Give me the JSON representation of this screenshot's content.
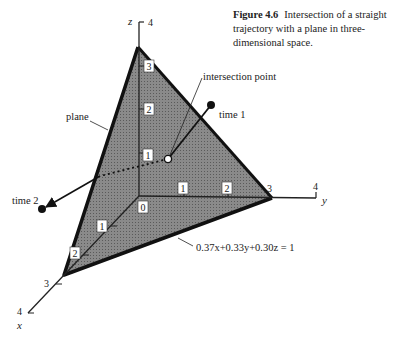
{
  "caption": {
    "figure_label": "Figure 4.6",
    "text": "Intersection of a straight trajectory with a plane in three-dimensional space."
  },
  "axes": {
    "x_label": "x",
    "y_label": "y",
    "z_label": "z",
    "x_ticks": [
      "1",
      "2",
      "3",
      "4"
    ],
    "y_ticks": [
      "1",
      "2",
      "3",
      "4"
    ],
    "z_ticks": [
      "1",
      "2",
      "3",
      "4"
    ],
    "origin_label": "0"
  },
  "annotations": {
    "plane": "plane",
    "intersection": "intersection point",
    "time1": "time 1",
    "time2": "time 2",
    "equation": "0.37x+0.33y+0.30z = 1"
  },
  "plane_intercepts": {
    "x": 2.7,
    "y": 3,
    "z": 3.3
  },
  "colors": {
    "plane_fill": "#7a7a7a",
    "edge": "#111111"
  }
}
